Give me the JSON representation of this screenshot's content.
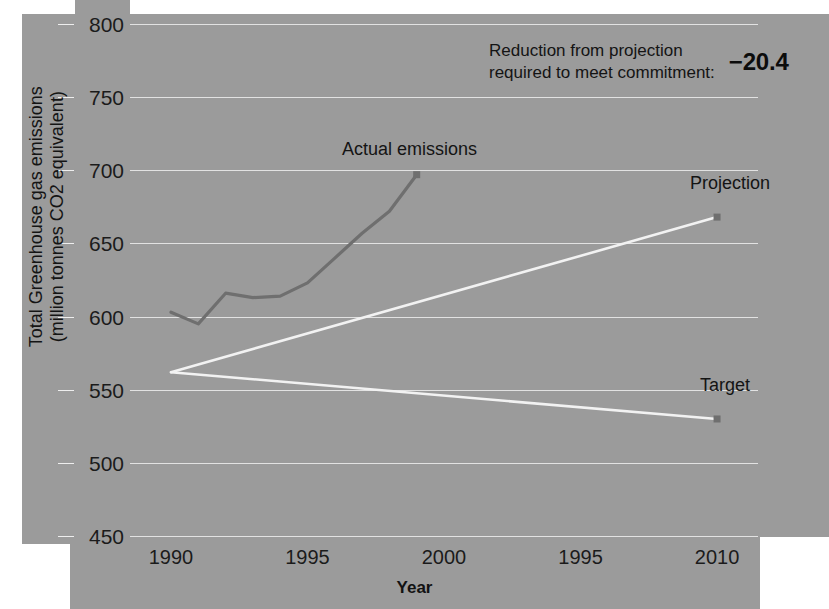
{
  "chart_data": {
    "type": "line",
    "title": "",
    "xlabel": "Year",
    "ylabel": "Total Greenhouse gas emissions (million tonnes CO2 equivalent)",
    "ylabel_line1": "Total Greenhouse gas emissions",
    "ylabel_line2": "(million tonnes CO2 equivalent)",
    "xlim": [
      1988.5,
      2011.5
    ],
    "ylim": [
      450,
      800
    ],
    "grid": true,
    "legend": "inline-labels",
    "yticks": [
      800,
      750,
      700,
      650,
      600,
      550,
      500,
      450
    ],
    "xticks": [
      1990,
      1995,
      2000,
      1995,
      2010
    ],
    "xtick_positions": [
      1990,
      1995,
      2000,
      2005,
      2010
    ],
    "series": [
      {
        "name": "Actual emissions",
        "color": "#6f6f6f",
        "marker": "square",
        "marker_at_end": true,
        "x": [
          1990,
          1991,
          1992,
          1993,
          1994,
          1995,
          1996,
          1997,
          1998,
          1999
        ],
        "values": [
          603,
          595,
          616,
          613,
          614,
          623,
          640,
          657,
          672,
          697
        ]
      },
      {
        "name": "Projection",
        "color": "#f2f2f2",
        "marker": "square",
        "marker_at_end": true,
        "x": [
          1990,
          2010
        ],
        "values": [
          562,
          668
        ]
      },
      {
        "name": "Target",
        "color": "#f2f2f2",
        "marker": "square",
        "marker_at_end": true,
        "x": [
          1990,
          2010
        ],
        "values": [
          562,
          530
        ]
      }
    ],
    "annotations": [
      {
        "name": "reduction-note",
        "text_line1": "Reduction from projection",
        "text_line2": "required to meet commitment:",
        "value": "−20.4"
      }
    ]
  },
  "colors": {
    "panel_background": "#9b9b9b",
    "page_background": "#ffffff",
    "gridline": "#e8e8e8",
    "actual_line": "#6f6f6f",
    "projection_line": "#f2f2f2",
    "target_line": "#f2f2f2",
    "marker_fill": "#6f6f6f",
    "text": "#141414"
  }
}
